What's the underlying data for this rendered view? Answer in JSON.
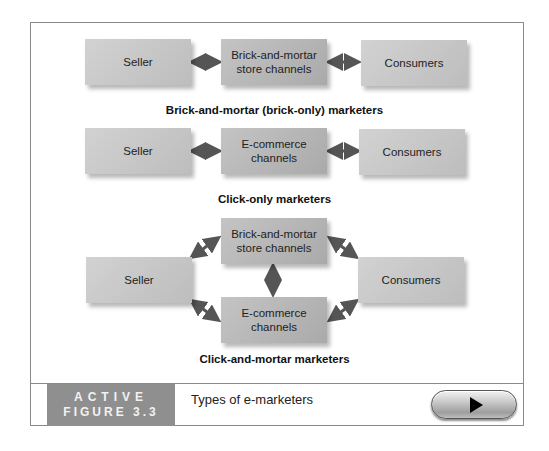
{
  "diagram": {
    "sections": [
      {
        "caption": "Brick-and-mortar (brick-only) marketers",
        "nodes": [
          "Seller",
          "Brick-and-mortar store channels",
          "Consumers"
        ],
        "nodes_lines": {
          "seller": "Seller",
          "channel_line1": "Brick-and-mortar",
          "channel_line2": "store channels",
          "consumers": "Consumers"
        }
      },
      {
        "caption": "Click-only marketers",
        "nodes": [
          "Seller",
          "E-commerce channels",
          "Consumers"
        ],
        "nodes_lines": {
          "seller": "Seller",
          "channel_line1": "E-commerce",
          "channel_line2": "channels",
          "consumers": "Consumers"
        }
      },
      {
        "caption": "Click-and-mortar marketers",
        "nodes": [
          "Seller",
          "Brick-and-mortar store channels",
          "E-commerce channels",
          "Consumers"
        ],
        "nodes_lines": {
          "seller": "Seller",
          "top_line1": "Brick-and-mortar",
          "top_line2": "store channels",
          "bottom_line1": "E-commerce",
          "bottom_line2": "channels",
          "consumers": "Consumers"
        }
      }
    ],
    "edges": [
      [
        "Seller",
        "Channel",
        "bidirectional"
      ],
      [
        "Channel",
        "Consumers",
        "bidirectional"
      ]
    ],
    "colors": {
      "box": "#c4c4c4",
      "arrow": "#555555",
      "label_block": "#8f8f8f",
      "frame": "#8a8a8a"
    }
  },
  "footer": {
    "label_line1": "ACTIVE",
    "label_line2": "FIGURE 3.3",
    "title": "Types of e-marketers",
    "play_button": "play-icon"
  }
}
